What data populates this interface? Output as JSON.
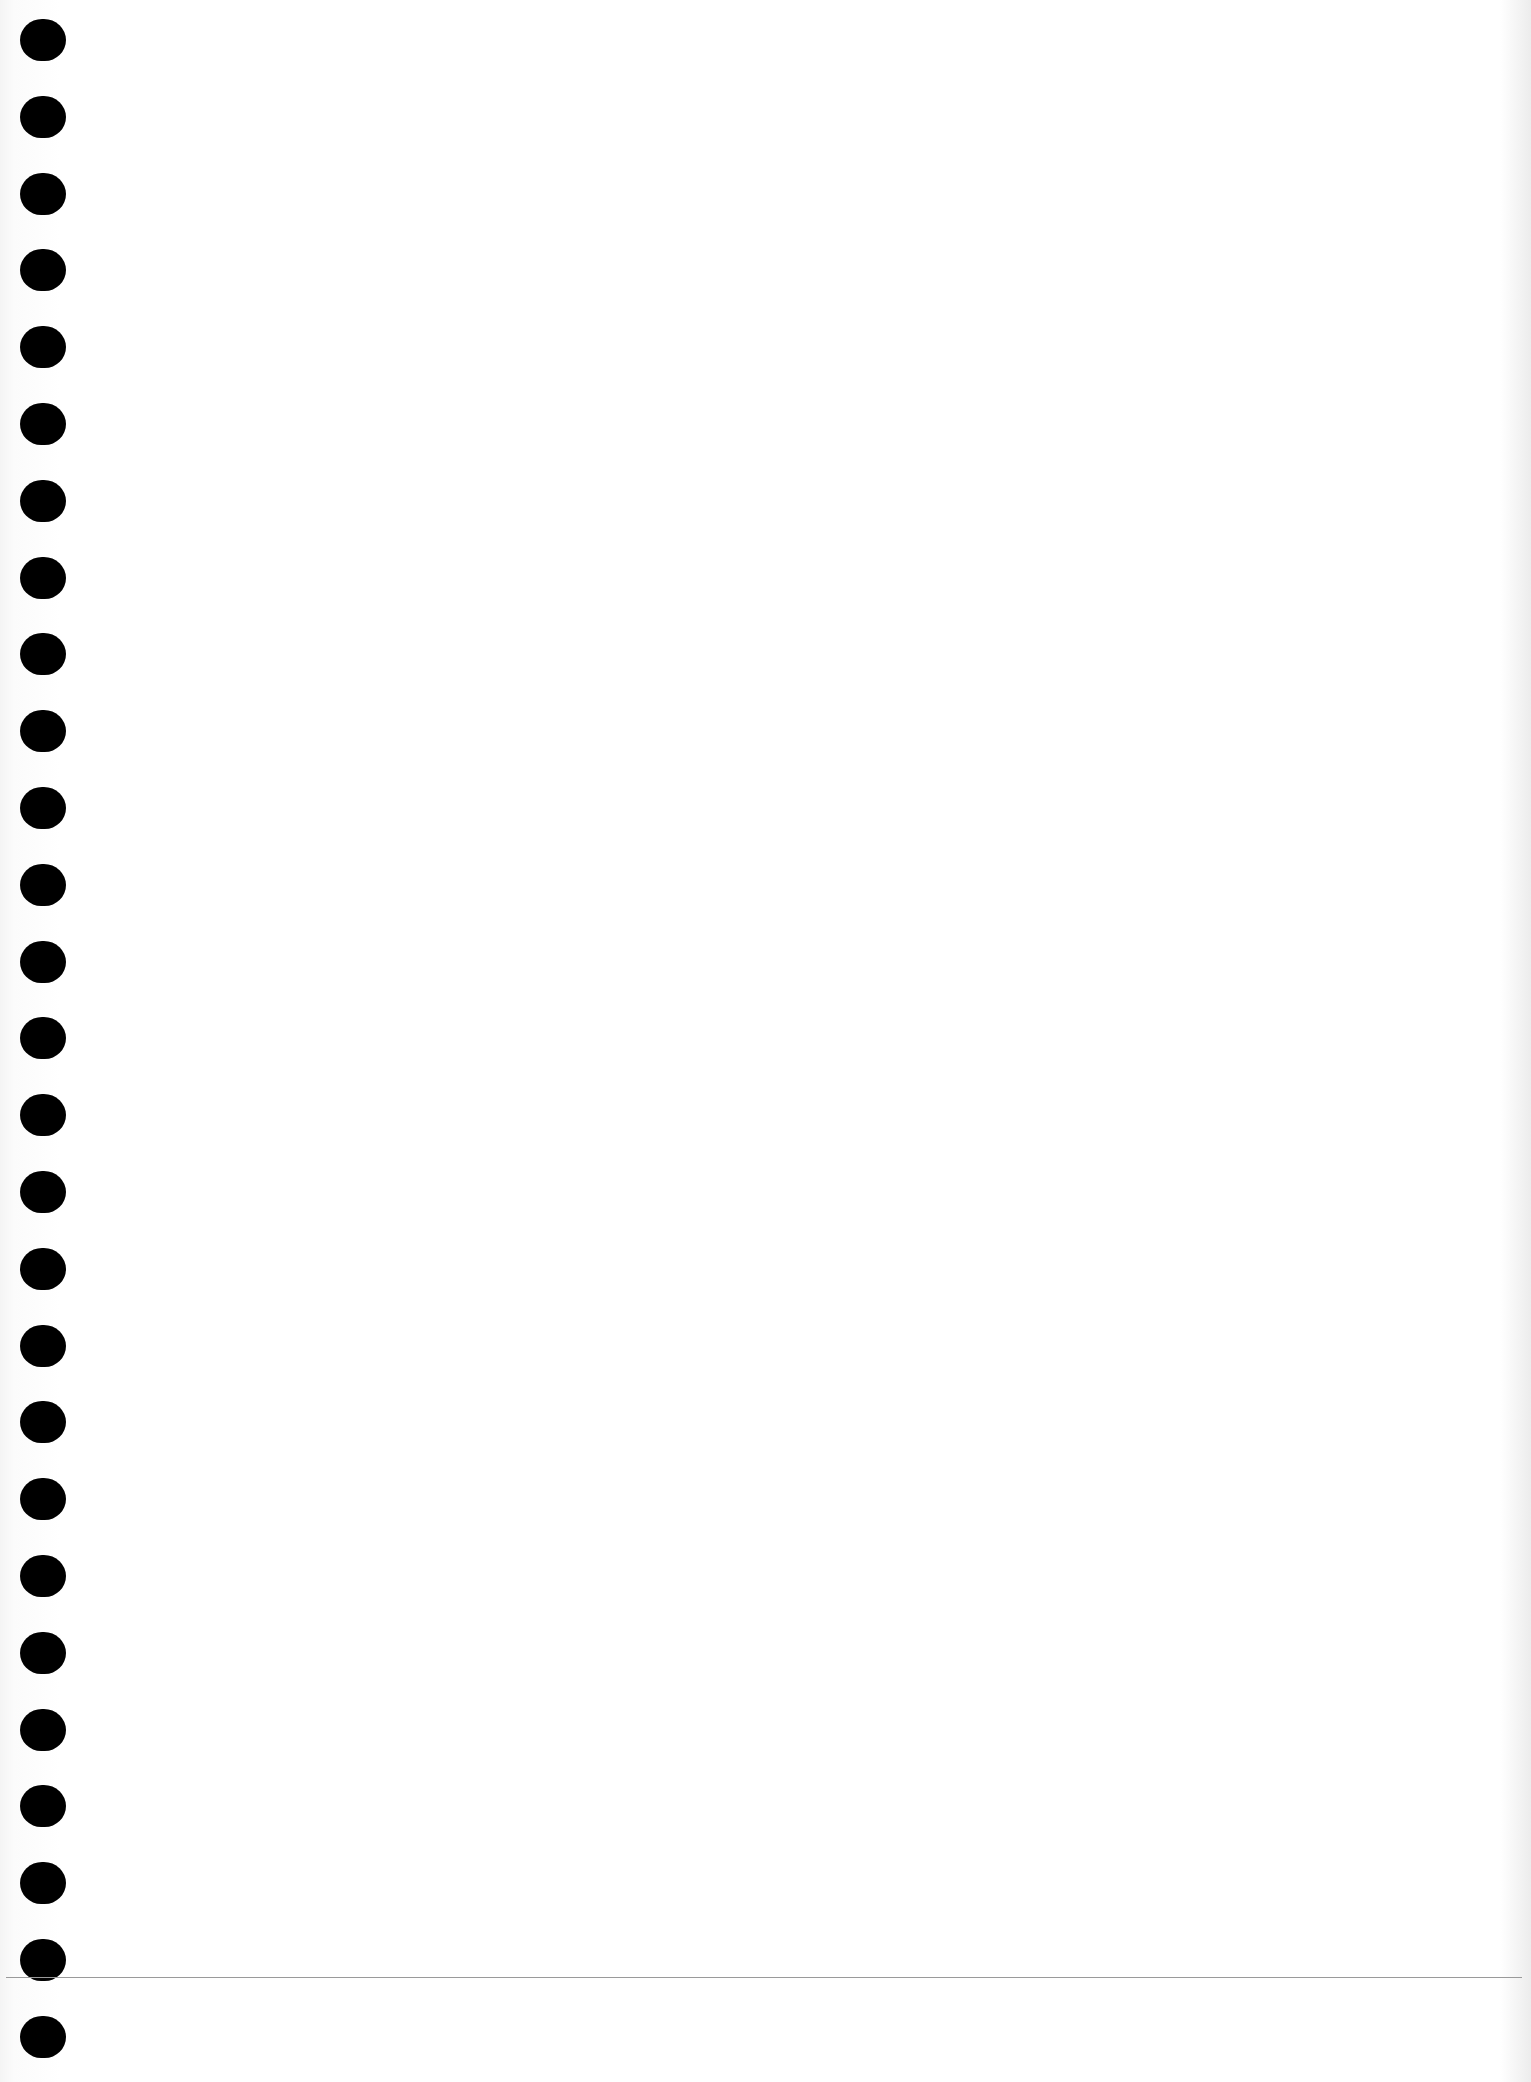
{
  "sheet": {
    "type": "blank-loose-leaf-paper",
    "background_color": "#ffffff",
    "hole_color": "#000000",
    "hole_count": 27,
    "hole_center_x": 43,
    "hole_first_center_y": 40,
    "hole_pitch": 76.8,
    "rule_line": {
      "y": 1977,
      "color": "#9a9a9a"
    }
  }
}
